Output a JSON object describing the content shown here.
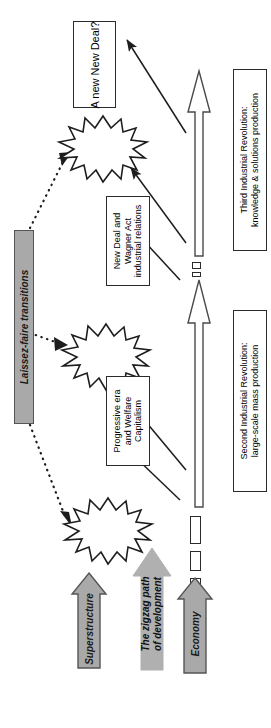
{
  "diagram": {
    "orientation": "rotated-90-counterclockwise"
  },
  "boxes": [
    {
      "id": "a-new-new-deal",
      "label": "A new New Deal?",
      "lines": [
        "A new New Deal?"
      ]
    },
    {
      "id": "new-deal-wagner-act",
      "label": "New Deal and Wagner Act industrial relations",
      "lines": [
        "New Deal and",
        "Wagner Act",
        "industrial relations"
      ]
    },
    {
      "id": "progressive-era",
      "label": "Progressive era and Welfare Capitalism",
      "lines": [
        "Progressive era",
        "and Welfare",
        "Capitalism"
      ]
    },
    {
      "id": "third-industrial-revolution",
      "label": "Third Industrial Revolution: knowledge & solutions production",
      "lines": [
        "Third Industrial Revolution:",
        "knowledge & solutions production"
      ]
    },
    {
      "id": "second-industrial-revolution",
      "label": "Second Industrial Revolution: large-scale mass production",
      "lines": [
        "Second Industrial Revolution:",
        "large-scale mass production"
      ]
    }
  ],
  "grey_shapes": [
    {
      "id": "laissez-faire-transitions",
      "label": "Laissez-faire transitions"
    },
    {
      "id": "superstructure",
      "label": "Superstructure"
    },
    {
      "id": "economy",
      "label": "Economy"
    },
    {
      "id": "zigzag-path",
      "label": "The zigzag path of development",
      "lines": [
        "The zigzag path",
        "of development"
      ]
    }
  ],
  "bursts": [
    {
      "id": "burst-top",
      "label": ""
    },
    {
      "id": "burst-middle",
      "label": ""
    },
    {
      "id": "burst-bottom",
      "label": ""
    }
  ],
  "colors": {
    "grey_fill": "#a9a9a9",
    "grey_stroke": "#555555",
    "zigzag_fill": "#b0b0b0",
    "outline": "#2b2b2b",
    "background": "#ffffff"
  }
}
